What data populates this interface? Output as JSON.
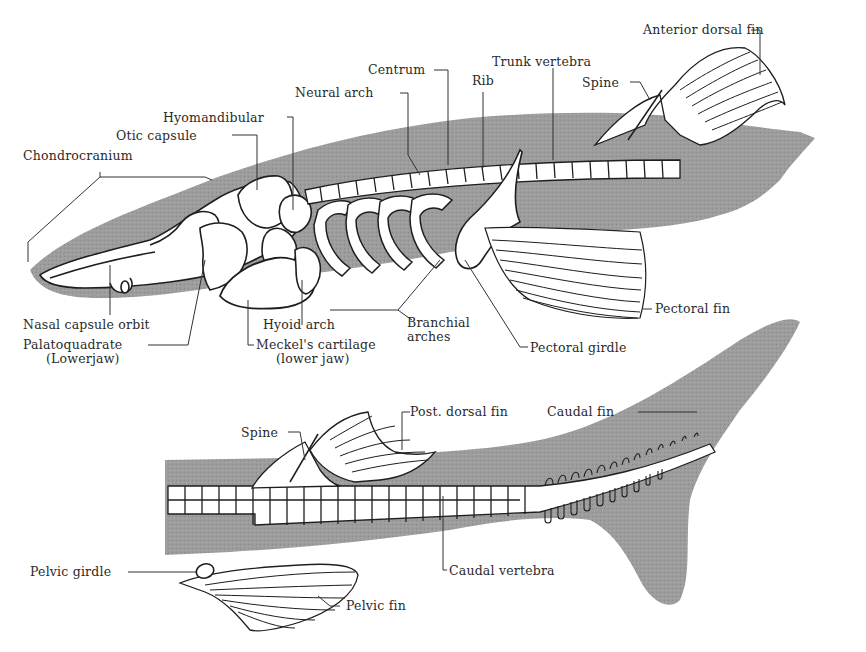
{
  "figure": {
    "colors": {
      "background": "#ffffff",
      "body_silhouette": "#9a9a9a",
      "bone_fill": "#ffffff",
      "outline": "#1e1e1e",
      "label_text": "#2a2a2a"
    },
    "panels": [
      {
        "id": "anterior",
        "description": "Head, trunk, anterior dorsal fin and pectoral fin"
      },
      {
        "id": "posterior",
        "description": "Posterior trunk, posterior dorsal fin, pelvic fin and caudal fin"
      }
    ]
  },
  "labels": {
    "anterior_dorsal_fin": "Anterior dorsal fin",
    "trunk_vertebra": "Trunk vertebra",
    "centrum": "Centrum",
    "rib": "Rib",
    "neural_arch": "Neural arch",
    "spine_anterior": "Spine",
    "hyomandibular": "Hyomandibular",
    "otic_capsule": "Otic capsule",
    "chondrocranium": "Chondrocranium",
    "nasal_capsule_orbit": "Nasal capsule orbit",
    "palatoquadrate": "Palatoquadrate",
    "palatoquadrate_note": "(Lowerjaw)",
    "hyoid_arch": "Hyoid arch",
    "meckels_cartilage": "Meckel's cartilage",
    "meckels_cartilage_note": "(lower jaw)",
    "branchial_arches_1": "Branchial",
    "branchial_arches_2": "arches",
    "pectoral_girdle": "Pectoral girdle",
    "pectoral_fin": "Pectoral fin",
    "spine_posterior": "Spine",
    "post_dorsal_fin": "Post. dorsal fin",
    "caudal_fin": "Caudal fin",
    "pelvic_girdle": "Pelvic girdle",
    "pelvic_fin": "Pelvic fin",
    "caudal_vertebra": "Caudal vertebra"
  }
}
